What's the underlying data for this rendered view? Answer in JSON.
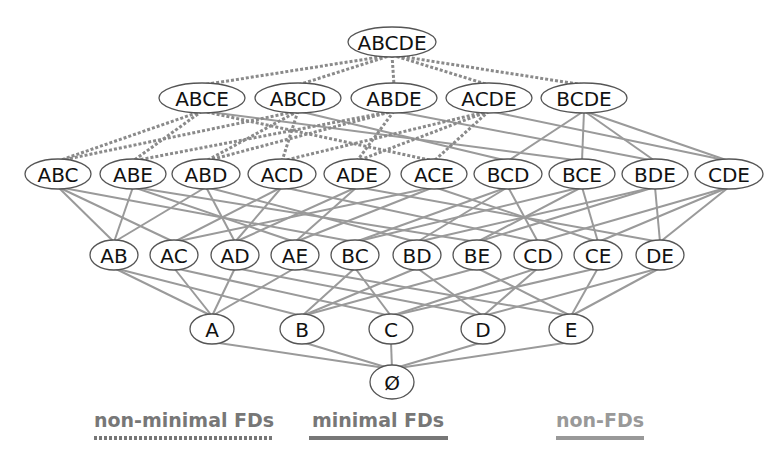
{
  "diagram": {
    "type": "attribute-lattice",
    "levels": [
      {
        "name": "level-5",
        "y": 42,
        "nodes": [
          {
            "id": "ABCDE",
            "x": 392,
            "w": 88
          }
        ]
      },
      {
        "name": "level-4",
        "y": 98,
        "nodes": [
          {
            "id": "ABCE",
            "x": 202,
            "w": 86
          },
          {
            "id": "ABCD",
            "x": 298,
            "w": 86
          },
          {
            "id": "ABDE",
            "x": 394,
            "w": 86
          },
          {
            "id": "ACDE",
            "x": 489,
            "w": 86
          },
          {
            "id": "BCDE",
            "x": 584,
            "w": 86
          }
        ]
      },
      {
        "name": "level-3",
        "y": 174,
        "nodes": [
          {
            "id": "ABC",
            "x": 58,
            "w": 66
          },
          {
            "id": "ABE",
            "x": 133,
            "w": 66
          },
          {
            "id": "ABD",
            "x": 206,
            "w": 68
          },
          {
            "id": "ACD",
            "x": 282,
            "w": 68
          },
          {
            "id": "ADE",
            "x": 357,
            "w": 66
          },
          {
            "id": "ACE",
            "x": 434,
            "w": 66
          },
          {
            "id": "BCD",
            "x": 508,
            "w": 68
          },
          {
            "id": "BCE",
            "x": 582,
            "w": 66
          },
          {
            "id": "BDE",
            "x": 655,
            "w": 66
          },
          {
            "id": "CDE",
            "x": 729,
            "w": 68
          }
        ]
      },
      {
        "name": "level-2",
        "y": 255,
        "nodes": [
          {
            "id": "AB",
            "x": 114,
            "w": 48
          },
          {
            "id": "AC",
            "x": 174,
            "w": 48
          },
          {
            "id": "AD",
            "x": 235,
            "w": 48
          },
          {
            "id": "AE",
            "x": 295,
            "w": 48
          },
          {
            "id": "BC",
            "x": 355,
            "w": 48
          },
          {
            "id": "BD",
            "x": 417,
            "w": 48
          },
          {
            "id": "BE",
            "x": 477,
            "w": 48
          },
          {
            "id": "CD",
            "x": 538,
            "w": 48
          },
          {
            "id": "CE",
            "x": 598,
            "w": 48
          },
          {
            "id": "DE",
            "x": 660,
            "w": 48
          }
        ]
      },
      {
        "name": "level-1",
        "y": 329,
        "nodes": [
          {
            "id": "A",
            "x": 212,
            "w": 44
          },
          {
            "id": "B",
            "x": 302,
            "w": 44
          },
          {
            "id": "C",
            "x": 391,
            "w": 44
          },
          {
            "id": "D",
            "x": 483,
            "w": 44
          },
          {
            "id": "E",
            "x": 571,
            "w": 44
          }
        ]
      },
      {
        "name": "level-0",
        "y": 382,
        "nodes": [
          {
            "id": "Ø",
            "x": 392,
            "w": 44
          }
        ]
      }
    ],
    "edge_styles": {
      "non_minimal_fd": {
        "color": "#8a8a8a",
        "dash": "3,2",
        "width": 3
      },
      "minimal_fd": {
        "color": "#7a7a7a",
        "width": 2.2
      },
      "non_fd": {
        "color": "#9a9a9a",
        "width": 2
      }
    },
    "non_minimal_edges": [
      [
        "ABCDE",
        "ABCE"
      ],
      [
        "ABCDE",
        "ABCD"
      ],
      [
        "ABCDE",
        "ABDE"
      ],
      [
        "ABCDE",
        "ACDE"
      ],
      [
        "ABCDE",
        "BCDE"
      ],
      [
        "ABCE",
        "ABC"
      ],
      [
        "ABCE",
        "ABE"
      ],
      [
        "ABCE",
        "ACE"
      ],
      [
        "ABCD",
        "ABC"
      ],
      [
        "ABCD",
        "ABD"
      ],
      [
        "ABCD",
        "ACD"
      ],
      [
        "ABDE",
        "ABE"
      ],
      [
        "ABDE",
        "ABD"
      ],
      [
        "ABDE",
        "ADE"
      ],
      [
        "ACDE",
        "ACD"
      ],
      [
        "ACDE",
        "ADE"
      ],
      [
        "ACDE",
        "ACE"
      ]
    ],
    "solid_edges": [
      [
        "ABCE",
        "BCE"
      ],
      [
        "ABCD",
        "BCD"
      ],
      [
        "ABDE",
        "BDE"
      ],
      [
        "ACDE",
        "CDE"
      ],
      [
        "BCDE",
        "BCD"
      ],
      [
        "BCDE",
        "BCE"
      ],
      [
        "BCDE",
        "BDE"
      ],
      [
        "BCDE",
        "CDE"
      ],
      [
        "ABC",
        "AB"
      ],
      [
        "ABC",
        "AC"
      ],
      [
        "ABC",
        "BC"
      ],
      [
        "ABE",
        "AB"
      ],
      [
        "ABE",
        "AE"
      ],
      [
        "ABE",
        "BE"
      ],
      [
        "ABD",
        "AB"
      ],
      [
        "ABD",
        "AD"
      ],
      [
        "ABD",
        "BD"
      ],
      [
        "ACD",
        "AC"
      ],
      [
        "ACD",
        "AD"
      ],
      [
        "ACD",
        "CD"
      ],
      [
        "ADE",
        "AD"
      ],
      [
        "ADE",
        "AE"
      ],
      [
        "ADE",
        "DE"
      ],
      [
        "ACE",
        "AC"
      ],
      [
        "ACE",
        "AE"
      ],
      [
        "ACE",
        "CE"
      ],
      [
        "BCD",
        "BC"
      ],
      [
        "BCD",
        "BD"
      ],
      [
        "BCD",
        "CD"
      ],
      [
        "BCE",
        "BC"
      ],
      [
        "BCE",
        "BE"
      ],
      [
        "BCE",
        "CE"
      ],
      [
        "BDE",
        "BD"
      ],
      [
        "BDE",
        "BE"
      ],
      [
        "BDE",
        "DE"
      ],
      [
        "CDE",
        "CD"
      ],
      [
        "CDE",
        "CE"
      ],
      [
        "CDE",
        "DE"
      ],
      [
        "AB",
        "A"
      ],
      [
        "AB",
        "B"
      ],
      [
        "AC",
        "A"
      ],
      [
        "AC",
        "C"
      ],
      [
        "AD",
        "A"
      ],
      [
        "AD",
        "D"
      ],
      [
        "AE",
        "A"
      ],
      [
        "AE",
        "E"
      ],
      [
        "BC",
        "B"
      ],
      [
        "BC",
        "C"
      ],
      [
        "BD",
        "B"
      ],
      [
        "BD",
        "D"
      ],
      [
        "BE",
        "B"
      ],
      [
        "BE",
        "E"
      ],
      [
        "CD",
        "C"
      ],
      [
        "CD",
        "D"
      ],
      [
        "CE",
        "C"
      ],
      [
        "CE",
        "E"
      ],
      [
        "DE",
        "D"
      ],
      [
        "DE",
        "E"
      ],
      [
        "A",
        "Ø"
      ],
      [
        "B",
        "Ø"
      ],
      [
        "C",
        "Ø"
      ],
      [
        "D",
        "Ø"
      ],
      [
        "E",
        "Ø"
      ]
    ]
  },
  "legend": {
    "non_minimal": {
      "label": "non-minimal FDs",
      "color": "#777777"
    },
    "minimal": {
      "label": "minimal FDs",
      "color": "#777777"
    },
    "non_fd": {
      "label": "non-FDs",
      "color": "#999999"
    }
  }
}
